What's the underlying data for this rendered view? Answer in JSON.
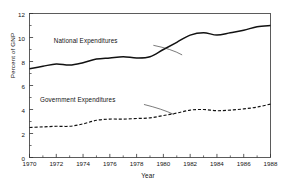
{
  "chart_data": {
    "type": "line",
    "title": "",
    "xlabel": "Year",
    "ylabel": "Percent of GNP",
    "xlim": [
      1970,
      1988
    ],
    "ylim": [
      0,
      12
    ],
    "grid": false,
    "legend_position": "inline-annotations",
    "xticks": [
      1970,
      1972,
      1974,
      1976,
      1978,
      1980,
      1982,
      1984,
      1986,
      1988
    ],
    "xtick_labels": [
      "1970",
      "1972",
      "1974",
      "1976",
      "1978",
      "1980",
      "1982",
      "1984",
      "1986",
      "1988"
    ],
    "xminor_step": 1,
    "yticks": [
      0,
      2,
      4,
      6,
      8,
      10,
      12
    ],
    "ytick_labels": [
      "0",
      "2",
      "4",
      "6",
      "8",
      "10",
      "12"
    ],
    "x": [
      1970,
      1971,
      1972,
      1973,
      1974,
      1975,
      1976,
      1977,
      1978,
      1979,
      1980,
      1981,
      1982,
      1983,
      1984,
      1985,
      1986,
      1987,
      1988
    ],
    "series": [
      {
        "name": "National Expenditures",
        "style": "solid",
        "color": "#111111",
        "values": [
          7.4,
          7.6,
          7.8,
          7.7,
          7.9,
          8.2,
          8.3,
          8.4,
          8.3,
          8.4,
          9.0,
          9.6,
          10.2,
          10.4,
          10.2,
          10.4,
          10.6,
          10.9,
          11.0
        ]
      },
      {
        "name": "Government Expenditures",
        "style": "dashed",
        "color": "#111111",
        "values": [
          2.5,
          2.55,
          2.6,
          2.6,
          2.8,
          3.1,
          3.2,
          3.2,
          3.25,
          3.3,
          3.5,
          3.7,
          3.95,
          4.0,
          3.9,
          3.95,
          4.05,
          4.2,
          4.45
        ]
      }
    ],
    "annotations": [
      {
        "text": "National Expenditures",
        "x": 1974.2,
        "y": 9.55
      },
      {
        "text": "Government Expenditures",
        "x": 1973.6,
        "y": 4.6
      }
    ]
  }
}
